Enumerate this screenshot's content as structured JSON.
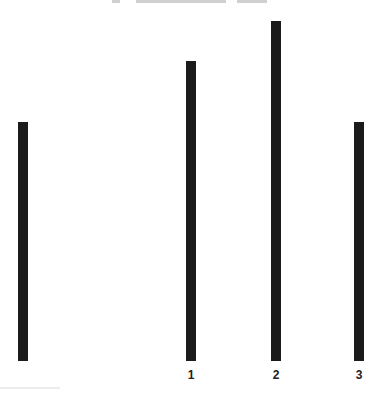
{
  "chart_data": {
    "type": "bar",
    "title": "",
    "categories": [
      "",
      "1",
      "2",
      "3"
    ],
    "values": [
      239,
      300,
      340,
      239
    ],
    "xlabel": "",
    "ylabel": "",
    "ylim": [
      0,
      340
    ],
    "grid": false,
    "legend": null,
    "bar_color": "#1b1b1b"
  },
  "layout": {
    "baseline_y": 361,
    "bar_x": [
      18,
      186,
      271,
      354
    ],
    "label_x": [
      23,
      191,
      276,
      359
    ]
  }
}
